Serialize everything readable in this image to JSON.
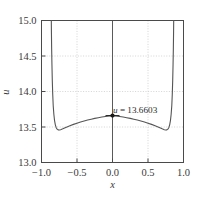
{
  "chart_data": {
    "type": "line",
    "title": "",
    "subtitle": "",
    "xlabel": "x",
    "ylabel": "u",
    "xlim": [
      -1.0,
      1.0
    ],
    "ylim": [
      13.0,
      15.0
    ],
    "xticks": [
      -1.0,
      -0.5,
      0.0,
      0.5,
      1.0
    ],
    "xtick_labels": [
      "−1.0",
      "−0.5",
      "0.0",
      "0.5",
      "1.0"
    ],
    "yticks": [
      13.0,
      13.5,
      14.0,
      14.5,
      15.0
    ],
    "ytick_labels": [
      "13.0",
      "13.5",
      "14.0",
      "14.5",
      "15.0"
    ],
    "grid": true,
    "grid_style": "dotted",
    "legend": "none",
    "series": [
      {
        "name": "u(x)",
        "color": "#555555",
        "x": [
          -0.862,
          -0.86,
          -0.857,
          -0.853,
          -0.848,
          -0.842,
          -0.835,
          -0.826,
          -0.816,
          -0.805,
          -0.793,
          -0.78,
          -0.766,
          -0.75,
          -0.73,
          -0.7,
          -0.65,
          -0.6,
          -0.55,
          -0.5,
          -0.45,
          -0.4,
          -0.35,
          -0.3,
          -0.25,
          -0.2,
          -0.15,
          -0.1,
          -0.05,
          0.0,
          0.05,
          0.1,
          0.15,
          0.2,
          0.25,
          0.3,
          0.35,
          0.4,
          0.45,
          0.5,
          0.55,
          0.6,
          0.65,
          0.7,
          0.73,
          0.75,
          0.766,
          0.78,
          0.793,
          0.805,
          0.816,
          0.826,
          0.835,
          0.842,
          0.848,
          0.853,
          0.857,
          0.86,
          0.862
        ],
        "y": [
          15.0,
          14.82,
          14.6,
          14.38,
          14.16,
          13.96,
          13.8,
          13.68,
          13.59,
          13.53,
          13.49,
          13.47,
          13.46,
          13.458,
          13.462,
          13.474,
          13.497,
          13.518,
          13.537,
          13.554,
          13.57,
          13.585,
          13.598,
          13.61,
          13.621,
          13.631,
          13.64,
          13.648,
          13.655,
          13.6603,
          13.655,
          13.648,
          13.64,
          13.631,
          13.621,
          13.61,
          13.598,
          13.585,
          13.57,
          13.554,
          13.537,
          13.518,
          13.497,
          13.474,
          13.462,
          13.458,
          13.46,
          13.47,
          13.49,
          13.53,
          13.59,
          13.68,
          13.8,
          13.96,
          14.16,
          14.38,
          14.6,
          14.82,
          15.0
        ]
      }
    ],
    "markers": [
      {
        "name": "center-point",
        "x": 0.0,
        "y": 13.6603,
        "label": "u = 13.6603",
        "label_variable": "u",
        "label_equals": " = ",
        "label_value": "13.6603",
        "color": "#1a1a1a"
      }
    ],
    "reference_lines": [
      {
        "name": "x-zero-vertical",
        "orientation": "vertical",
        "value": 0.0,
        "color": "#5a5a5a"
      }
    ],
    "colors": {
      "curve": "#555555",
      "frame": "#4a4a4a",
      "grid": "#c9c9c9",
      "marker": "#1a1a1a",
      "text": "#3a3a3a",
      "background": "#ffffff"
    }
  }
}
